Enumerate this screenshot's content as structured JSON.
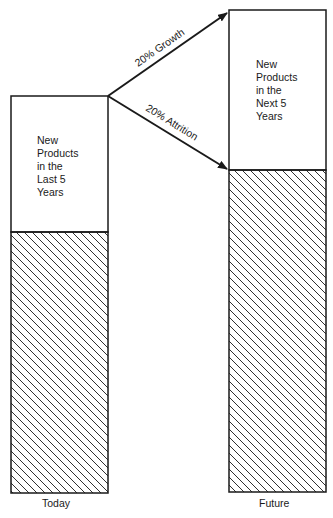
{
  "diagram": {
    "type": "stacked-bar-transition",
    "bars": [
      {
        "id": "today",
        "caption": "Today",
        "top_segment_label": "New\nProducts\nin the\nLast 5\nYears",
        "bottom_segment": "hatched"
      },
      {
        "id": "future",
        "caption": "Future",
        "top_segment_label": "New\nProducts\nin the\nNext 5\nYears",
        "bottom_segment": "hatched"
      }
    ],
    "arrows": [
      {
        "label": "20% Growth",
        "from": "today-top",
        "to": "future-top"
      },
      {
        "label": "20% Attrition",
        "from": "today-top",
        "to": "future-divider"
      }
    ],
    "colors": {
      "stroke": "#1a1a1a",
      "background": "#ffffff"
    }
  }
}
